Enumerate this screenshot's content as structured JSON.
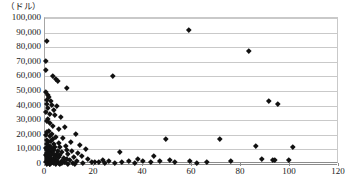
{
  "chart_data": {
    "type": "scatter",
    "title": "",
    "subtitle": "",
    "unit_label": "（ドル）",
    "xlabel": "",
    "ylabel": "",
    "xlim": [
      0,
      120
    ],
    "ylim": [
      0,
      100000
    ],
    "xticks": [
      0,
      20,
      40,
      60,
      80,
      100,
      120
    ],
    "xtick_labels": [
      "0",
      "20",
      "40",
      "60",
      "80",
      "100",
      "120"
    ],
    "yticks": [
      0,
      10000,
      20000,
      30000,
      40000,
      50000,
      60000,
      70000,
      80000,
      90000,
      100000
    ],
    "ytick_labels": [
      "0",
      "10,000",
      "20,000",
      "30,000",
      "40,000",
      "50,000",
      "60,000",
      "70,000",
      "80,000",
      "90,000",
      "100,000"
    ],
    "grid": true,
    "grid_axis": "y",
    "legend": false,
    "legend_position": "none",
    "marker": "diamond",
    "marker_color": "#111111",
    "series": [
      {
        "name": "",
        "points": [
          [
            0.6,
            84500
          ],
          [
            0.5,
            71000
          ],
          [
            0.3,
            64500
          ],
          [
            3.0,
            60500
          ],
          [
            4.4,
            58500
          ],
          [
            5.3,
            57000
          ],
          [
            8.8,
            52500
          ],
          [
            27.5,
            60500
          ],
          [
            0.4,
            49500
          ],
          [
            1.0,
            47500
          ],
          [
            1.4,
            46000
          ],
          [
            0.7,
            44000
          ],
          [
            2.2,
            43500
          ],
          [
            0.9,
            41500
          ],
          [
            2.6,
            40500
          ],
          [
            5.0,
            40000
          ],
          [
            1.2,
            38500
          ],
          [
            3.4,
            37000
          ],
          [
            0.5,
            35500
          ],
          [
            1.8,
            34500
          ],
          [
            4.0,
            33500
          ],
          [
            6.5,
            32000
          ],
          [
            1.1,
            31000
          ],
          [
            0.6,
            29500
          ],
          [
            2.0,
            28000
          ],
          [
            3.2,
            26500
          ],
          [
            8.0,
            25500
          ],
          [
            5.5,
            24000
          ],
          [
            1.5,
            23000
          ],
          [
            0.8,
            22000
          ],
          [
            2.8,
            21000
          ],
          [
            12.5,
            20500
          ],
          [
            0.4,
            20000
          ],
          [
            1.9,
            19000
          ],
          [
            4.6,
            18500
          ],
          [
            7.2,
            18000
          ],
          [
            3.0,
            17000
          ],
          [
            0.9,
            16500
          ],
          [
            2.3,
            16000
          ],
          [
            10.5,
            15500
          ],
          [
            1.3,
            15000
          ],
          [
            5.8,
            14500
          ],
          [
            0.6,
            14000
          ],
          [
            3.6,
            13500
          ],
          [
            14.0,
            13000
          ],
          [
            2.0,
            12800
          ],
          [
            8.5,
            12500
          ],
          [
            1.0,
            12000
          ],
          [
            4.2,
            11800
          ],
          [
            6.0,
            11500
          ],
          [
            0.5,
            11000
          ],
          [
            2.6,
            10800
          ],
          [
            16.5,
            10500
          ],
          [
            1.6,
            10200
          ],
          [
            9.0,
            10000
          ],
          [
            3.4,
            9800
          ],
          [
            0.8,
            9500
          ],
          [
            5.2,
            9200
          ],
          [
            11.0,
            9000
          ],
          [
            2.2,
            8800
          ],
          [
            1.2,
            8500
          ],
          [
            7.0,
            8200
          ],
          [
            13.5,
            8000
          ],
          [
            0.6,
            7800
          ],
          [
            3.0,
            7500
          ],
          [
            4.8,
            7200
          ],
          [
            1.8,
            7000
          ],
          [
            9.5,
            6800
          ],
          [
            0.4,
            6500
          ],
          [
            2.5,
            6300
          ],
          [
            6.2,
            6000
          ],
          [
            15.0,
            5800
          ],
          [
            1.1,
            5600
          ],
          [
            3.8,
            5400
          ],
          [
            0.9,
            5200
          ],
          [
            5.6,
            5000
          ],
          [
            11.8,
            4800
          ],
          [
            2.0,
            4600
          ],
          [
            7.5,
            4400
          ],
          [
            1.4,
            4200
          ],
          [
            4.0,
            4000
          ],
          [
            0.6,
            3900
          ],
          [
            8.8,
            3700
          ],
          [
            2.8,
            3500
          ],
          [
            17.5,
            3400
          ],
          [
            1.0,
            3200
          ],
          [
            5.0,
            3000
          ],
          [
            3.2,
            2900
          ],
          [
            10.0,
            2700
          ],
          [
            0.8,
            2500
          ],
          [
            2.2,
            2400
          ],
          [
            6.8,
            2200
          ],
          [
            13.0,
            2000
          ],
          [
            1.6,
            1900
          ],
          [
            4.4,
            1800
          ],
          [
            0.5,
            1600
          ],
          [
            3.0,
            1500
          ],
          [
            8.0,
            1400
          ],
          [
            19.0,
            1300
          ],
          [
            1.2,
            1200
          ],
          [
            5.8,
            1100
          ],
          [
            2.5,
            1000
          ],
          [
            11.5,
            900
          ],
          [
            0.7,
            800
          ],
          [
            7.0,
            700
          ],
          [
            3.6,
            600
          ],
          [
            15.5,
            500
          ],
          [
            1.8,
            450
          ],
          [
            9.2,
            400
          ],
          [
            4.6,
            350
          ],
          [
            2.0,
            300
          ],
          [
            6.0,
            250
          ],
          [
            12.0,
            200
          ],
          [
            0.9,
            150
          ],
          [
            20.5,
            1800
          ],
          [
            22.0,
            1200
          ],
          [
            23.5,
            3000
          ],
          [
            24.5,
            900
          ],
          [
            26.0,
            2000
          ],
          [
            28.5,
            800
          ],
          [
            30.5,
            8500
          ],
          [
            31.5,
            1500
          ],
          [
            34.0,
            2500
          ],
          [
            36.5,
            1000
          ],
          [
            38.0,
            3500
          ],
          [
            40.0,
            2200
          ],
          [
            43.0,
            1200
          ],
          [
            44.5,
            5500
          ],
          [
            47.0,
            2000
          ],
          [
            49.5,
            17500
          ],
          [
            51.0,
            3000
          ],
          [
            53.0,
            1500
          ],
          [
            58.5,
            92000
          ],
          [
            59.0,
            2500
          ],
          [
            62.0,
            1000
          ],
          [
            66.0,
            1800
          ],
          [
            71.5,
            17000
          ],
          [
            76.0,
            2000
          ],
          [
            83.0,
            77500
          ],
          [
            86.0,
            12500
          ],
          [
            88.5,
            3500
          ],
          [
            91.5,
            43500
          ],
          [
            93.0,
            2800
          ],
          [
            93.8,
            2600
          ],
          [
            95.0,
            41000
          ],
          [
            99.5,
            3200
          ],
          [
            101.0,
            12000
          ]
        ]
      }
    ]
  },
  "footnote": {
    "text": ""
  }
}
